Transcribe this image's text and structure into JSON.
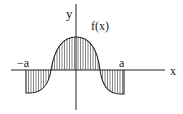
{
  "figure": {
    "labels": {
      "y_axis": "y",
      "x_axis": "x",
      "function": "f(x)",
      "neg_a": "−a",
      "pos_a": "a"
    },
    "colors": {
      "stroke": "#222222",
      "hatch": "#333333",
      "background": "#ffffff"
    }
  }
}
